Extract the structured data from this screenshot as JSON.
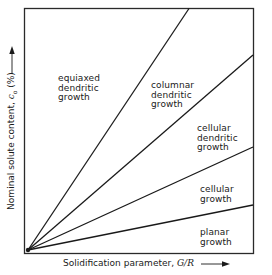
{
  "diagram": {
    "type": "solidification-regime-map",
    "x_axis": {
      "label": "Solidification parameter, ",
      "symbol": "G/R",
      "arrow": "→"
    },
    "y_axis": {
      "label": "Nominal solute content, ",
      "symbol": "c",
      "subscript": "o",
      "unit": " (%)",
      "arrow": "→"
    },
    "regions": [
      {
        "id": "equiaxed-dendritic",
        "lines": [
          "equiaxed",
          "dendritic",
          "growth"
        ]
      },
      {
        "id": "columnar-dendritic",
        "lines": [
          "columnar",
          "dendritic",
          "growth"
        ]
      },
      {
        "id": "cellular-dendritic",
        "lines": [
          "cellular",
          "dendritic",
          "growth"
        ]
      },
      {
        "id": "cellular",
        "lines": [
          "cellular",
          "growth"
        ]
      },
      {
        "id": "planar",
        "lines": [
          "planar",
          "growth"
        ]
      }
    ],
    "boundary_lines": [
      {
        "from": [
          28,
          248
        ],
        "to": [
          189,
          8
        ]
      },
      {
        "from": [
          28,
          248
        ],
        "to": [
          253,
          55
        ]
      },
      {
        "from": [
          28,
          248
        ],
        "to": [
          253,
          147
        ]
      },
      {
        "from": [
          28,
          248
        ],
        "to": [
          253,
          205
        ]
      }
    ],
    "colors": {
      "ink": "#1a1a1a",
      "background": "#ffffff"
    }
  }
}
